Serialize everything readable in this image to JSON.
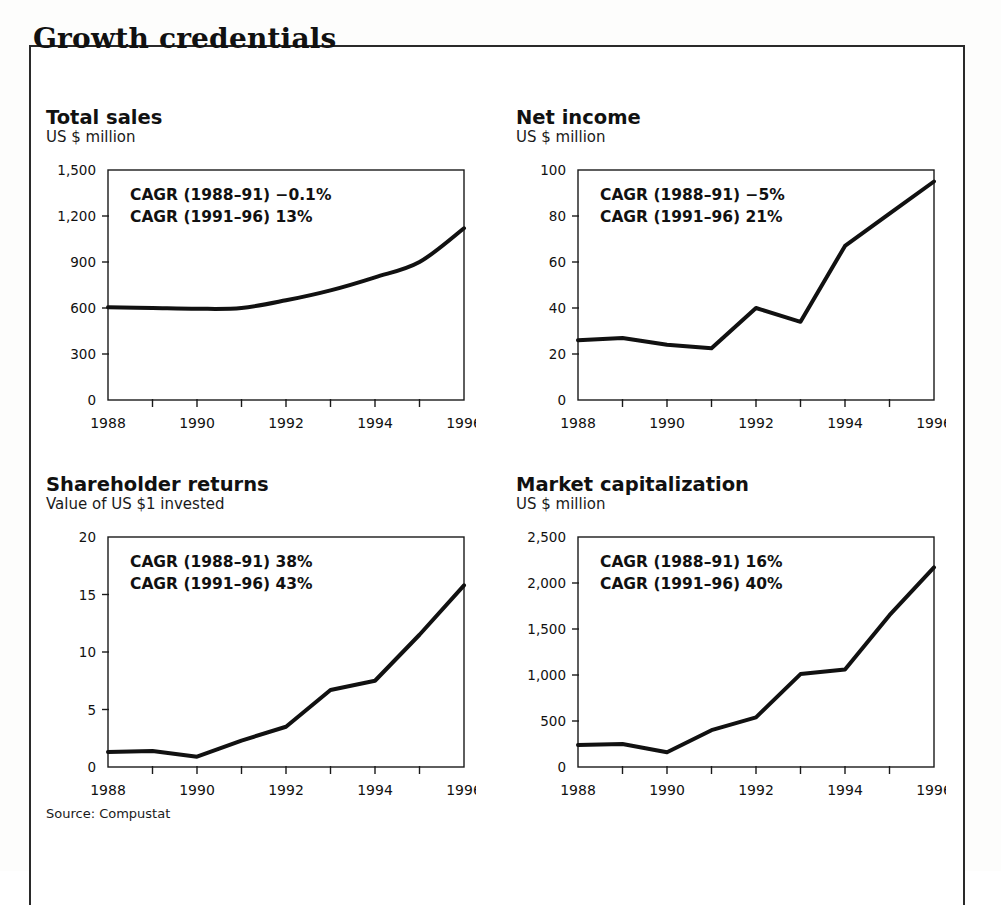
{
  "exhibit": {
    "title": "Growth credentials",
    "source": "Source: Compustat"
  },
  "panels": {
    "total_sales": {
      "title": "Total sales",
      "subtitle": "US $ million",
      "cagr1": "CAGR (1988–91) −0.1%",
      "cagr2": "CAGR (1991–96) 13%"
    },
    "net_income": {
      "title": "Net income",
      "subtitle": "US $ million",
      "cagr1": "CAGR (1988–91) −5%",
      "cagr2": "CAGR (1991–96) 21%"
    },
    "shareholder_returns": {
      "title": "Shareholder returns",
      "subtitle": "Value of US $1 invested",
      "cagr1": "CAGR (1988–91) 38%",
      "cagr2": "CAGR (1991–96) 43%"
    },
    "market_capitalization": {
      "title": "Market capitalization",
      "subtitle": "US $ million",
      "cagr1": "CAGR (1988–91) 16%",
      "cagr2": "CAGR (1991–96) 40%"
    }
  },
  "chart_data": [
    {
      "id": "total_sales",
      "type": "line",
      "title": "Total sales",
      "subtitle": "US $ million",
      "xlabel": "",
      "ylabel": "US $ million",
      "x": [
        1988,
        1989,
        1990,
        1991,
        1992,
        1993,
        1994,
        1995,
        1996
      ],
      "values": [
        605,
        600,
        595,
        600,
        650,
        715,
        800,
        900,
        1120
      ],
      "xlim": [
        1988,
        1996
      ],
      "ylim": [
        0,
        1500
      ],
      "yticks": [
        0,
        300,
        600,
        900,
        1200,
        1500
      ],
      "ytick_labels": [
        "0",
        "300",
        "600",
        "900",
        "1,200",
        "1,500"
      ],
      "xticks": [
        1988,
        1989,
        1990,
        1991,
        1992,
        1993,
        1994,
        1995,
        1996
      ],
      "xtick_labels": [
        "1988",
        "",
        "1990",
        "",
        "1992",
        "",
        "1994",
        "",
        "1996"
      ],
      "grid": false,
      "legend": "none",
      "annotations": [
        "CAGR (1988–91) −0.1%",
        "CAGR (1991–96) 13%"
      ],
      "line_color": "#111111"
    },
    {
      "id": "net_income",
      "type": "line",
      "title": "Net income",
      "subtitle": "US $ million",
      "xlabel": "",
      "ylabel": "US $ million",
      "x": [
        1988,
        1989,
        1990,
        1991,
        1992,
        1993,
        1994,
        1995,
        1996
      ],
      "values": [
        26,
        27,
        24,
        22.5,
        40,
        34,
        67,
        81,
        95
      ],
      "xlim": [
        1988,
        1996
      ],
      "ylim": [
        0,
        100
      ],
      "yticks": [
        0,
        20,
        40,
        60,
        80,
        100
      ],
      "ytick_labels": [
        "0",
        "20",
        "40",
        "60",
        "80",
        "100"
      ],
      "xticks": [
        1988,
        1989,
        1990,
        1991,
        1992,
        1993,
        1994,
        1995,
        1996
      ],
      "xtick_labels": [
        "1988",
        "",
        "1990",
        "",
        "1992",
        "",
        "1994",
        "",
        "1996"
      ],
      "grid": false,
      "legend": "none",
      "annotations": [
        "CAGR (1988–91) −5%",
        "CAGR (1991–96) 21%"
      ],
      "line_color": "#111111"
    },
    {
      "id": "shareholder_returns",
      "type": "line",
      "title": "Shareholder returns",
      "subtitle": "Value of US $1 invested",
      "xlabel": "",
      "ylabel": "Value of US $1 invested",
      "x": [
        1988,
        1989,
        1990,
        1991,
        1992,
        1993,
        1994,
        1995,
        1996
      ],
      "values": [
        1.3,
        1.4,
        0.9,
        2.3,
        3.5,
        6.7,
        7.5,
        11.5,
        15.8
      ],
      "xlim": [
        1988,
        1996
      ],
      "ylim": [
        0,
        20
      ],
      "yticks": [
        0,
        5,
        10,
        15,
        20
      ],
      "ytick_labels": [
        "0",
        "5",
        "10",
        "15",
        "20"
      ],
      "xticks": [
        1988,
        1989,
        1990,
        1991,
        1992,
        1993,
        1994,
        1995,
        1996
      ],
      "xtick_labels": [
        "1988",
        "",
        "1990",
        "",
        "1992",
        "",
        "1994",
        "",
        "1996"
      ],
      "grid": false,
      "legend": "none",
      "annotations": [
        "CAGR (1988–91) 38%",
        "CAGR (1991–96) 43%"
      ],
      "line_color": "#111111"
    },
    {
      "id": "market_capitalization",
      "type": "line",
      "title": "Market capitalization",
      "subtitle": "US $ million",
      "xlabel": "",
      "ylabel": "US $ million",
      "x": [
        1988,
        1989,
        1990,
        1991,
        1992,
        1993,
        1994,
        1995,
        1996
      ],
      "values": [
        240,
        250,
        160,
        400,
        540,
        1010,
        1060,
        1650,
        2170
      ],
      "xlim": [
        1988,
        1996
      ],
      "ylim": [
        0,
        2500
      ],
      "yticks": [
        0,
        500,
        1000,
        1500,
        2000,
        2500
      ],
      "ytick_labels": [
        "0",
        "500",
        "1,000",
        "1,500",
        "2,000",
        "2,500"
      ],
      "xticks": [
        1988,
        1989,
        1990,
        1991,
        1992,
        1993,
        1994,
        1995,
        1996
      ],
      "xtick_labels": [
        "1988",
        "",
        "1990",
        "",
        "1992",
        "",
        "1994",
        "",
        "1996"
      ],
      "grid": false,
      "legend": "none",
      "annotations": [
        "CAGR (1988–91) 16%",
        "CAGR (1991–96) 40%"
      ],
      "line_color": "#111111"
    }
  ]
}
